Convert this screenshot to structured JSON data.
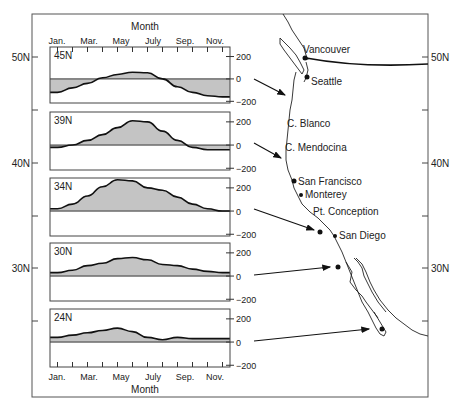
{
  "chart_data": {
    "type": "area",
    "title": "",
    "xlabel": "Month",
    "ylabel": "",
    "x_tick_labels": [
      "Jan.",
      "Mar.",
      "May",
      "July",
      "Sep.",
      "Nov."
    ],
    "x": [
      "Jan",
      "Feb",
      "Mar",
      "Apr",
      "May",
      "Jun",
      "Jul",
      "Aug",
      "Sep",
      "Oct",
      "Nov",
      "Dec"
    ],
    "y_tick_labels": [
      "200",
      "0",
      "−200"
    ],
    "ylim": [
      -300,
      300
    ],
    "grid": false,
    "latitude_axis": {
      "labels": [
        "50N",
        "40N",
        "30N"
      ]
    },
    "series": [
      {
        "name": "45N",
        "values": [
          -120,
          -80,
          -40,
          10,
          40,
          60,
          55,
          0,
          -70,
          -120,
          -150,
          -160
        ]
      },
      {
        "name": "39N",
        "values": [
          -20,
          0,
          40,
          90,
          150,
          210,
          200,
          120,
          40,
          -20,
          -40,
          -40
        ]
      },
      {
        "name": "34N",
        "values": [
          20,
          60,
          130,
          210,
          270,
          260,
          200,
          180,
          120,
          60,
          20,
          0
        ]
      },
      {
        "name": "30N",
        "values": [
          30,
          50,
          90,
          110,
          150,
          160,
          140,
          100,
          90,
          60,
          40,
          30
        ]
      },
      {
        "name": "24N",
        "values": [
          40,
          60,
          80,
          100,
          120,
          90,
          40,
          20,
          40,
          30,
          30,
          30
        ]
      }
    ],
    "annotations": [
      "45N",
      "39N",
      "34N",
      "30N",
      "24N"
    ]
  },
  "map": {
    "places": [
      {
        "name": "Vancouver",
        "x": 302,
        "y": 57
      },
      {
        "name": "Seattle",
        "x": 306,
        "y": 76
      },
      {
        "name": "C. Blanco",
        "x": 0,
        "y": 0
      },
      {
        "name": "C. Mendocina",
        "x": 0,
        "y": 0
      },
      {
        "name": "San Francisco",
        "x": 294,
        "y": 181
      },
      {
        "name": "Monterey",
        "x": 300,
        "y": 195
      },
      {
        "name": "Pt. Conception",
        "x": 0,
        "y": 0
      },
      {
        "name": "San Diego",
        "x": 334,
        "y": 235
      }
    ],
    "labels": {
      "vancouver": "Vancouver",
      "seattle": "Seattle",
      "c_blanco": "C. Blanco",
      "c_mendocina": "C. Mendocina",
      "san_francisco": "San Francisco",
      "monterey": "Monterey",
      "pt_conception": "Pt. Conception",
      "san_diego": "San Diego"
    }
  },
  "labels": {
    "month_top": "Month",
    "month_bottom": "Month",
    "lat_50": "50N",
    "lat_40": "40N",
    "lat_30": "30N",
    "m_jan": "Jan.",
    "m_mar": "Mar.",
    "m_may": "May",
    "m_jul": "July",
    "m_sep": "Sep.",
    "m_nov": "Nov.",
    "y200": "200",
    "y0": "0",
    "yneg200": "−200",
    "p45": "45N",
    "p39": "39N",
    "p34": "34N",
    "p30": "30N",
    "p24": "24N"
  }
}
